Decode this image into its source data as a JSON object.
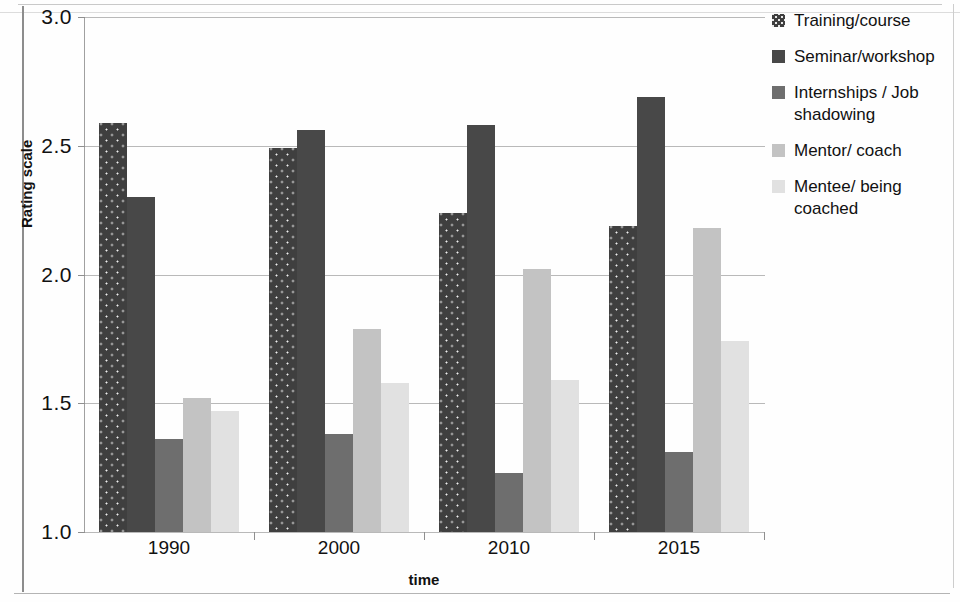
{
  "chart_data": {
    "type": "bar",
    "title": "",
    "xlabel": "time",
    "ylabel": "Rating scale",
    "categories": [
      "1990",
      "2000",
      "2010",
      "2015"
    ],
    "ylim": [
      1.0,
      3.0
    ],
    "yticks": [
      "1.0",
      "1.5",
      "2.0",
      "2.5",
      "3.0"
    ],
    "ytick_values": [
      1.0,
      1.5,
      2.0,
      2.5,
      3.0
    ],
    "grid": true,
    "legend_position": "right",
    "series": [
      {
        "name": "Training/course",
        "color": "#3f3f3f",
        "pattern": "dotted",
        "values": [
          2.59,
          2.49,
          2.24,
          2.19
        ]
      },
      {
        "name": "Seminar/workshop",
        "color": "#484848",
        "pattern": "solid",
        "values": [
          2.3,
          2.56,
          2.58,
          2.69
        ]
      },
      {
        "name": "Internships / Job shadowing",
        "color": "#6e6e6e",
        "pattern": "solid",
        "values": [
          1.36,
          1.38,
          1.23,
          1.31
        ]
      },
      {
        "name": "Mentor/ coach",
        "color": "#c3c3c3",
        "pattern": "solid",
        "values": [
          1.52,
          1.79,
          2.02,
          2.18
        ]
      },
      {
        "name": "Mentee/ being coached",
        "color": "#e1e1e1",
        "pattern": "solid",
        "values": [
          1.47,
          1.58,
          1.59,
          1.74
        ]
      }
    ]
  },
  "axes": {
    "y_title": "Rating scale",
    "x_title": "time",
    "y_ticks": [
      "3.0",
      "2.5",
      "2.0",
      "1.5",
      "1.0"
    ],
    "x_ticks": [
      "1990",
      "2000",
      "2010",
      "2015"
    ]
  },
  "legend": {
    "items": [
      {
        "label": "Training/course"
      },
      {
        "label": "Seminar/workshop"
      },
      {
        "label": "Internships / Job shadowing"
      },
      {
        "label": "Mentor/ coach"
      },
      {
        "label": "Mentee/ being coached"
      }
    ]
  }
}
